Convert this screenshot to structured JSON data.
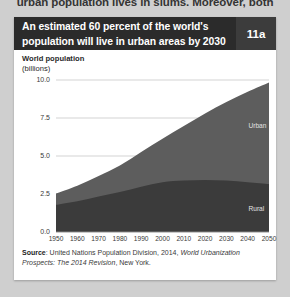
{
  "page": {
    "bleed_text_top": "urban population lives in slums. Moreover, both"
  },
  "figure": {
    "title": "An estimated 60 percent of the world's population will live in urban areas by 2030",
    "badge": "11a",
    "axis_heading_main": "World population",
    "axis_heading_unit": "(billions)",
    "source_prefix": "Source",
    "source_text_a": ": United Nations Population Division, 2014, ",
    "source_italic_a": "World Urbanization Prospects: The 2014 Revision",
    "source_text_b": ", New York.",
    "colors": {
      "title_bar": "#2b2b2b",
      "badge_bg": "#3c3c3c",
      "urban_fill": "#5d5d5d",
      "rural_fill": "#3b3b3b",
      "gridline": "#c8c8c8",
      "panel_bg": "#ffffff",
      "page_bg": "#cfcfcf"
    }
  },
  "chart_data": {
    "type": "area",
    "stacked": true,
    "title": "An estimated 60 percent of the world's population will live in urban areas by 2030",
    "xlabel": "",
    "ylabel": "World population (billions)",
    "x": [
      1950,
      1960,
      1970,
      1980,
      1990,
      2000,
      2010,
      2020,
      2030,
      2040,
      2050
    ],
    "xlim": [
      1950,
      2050
    ],
    "ylim": [
      0.0,
      10.0
    ],
    "yticks": [
      "0.0",
      "2.5",
      "5.0",
      "7.5",
      "10.0"
    ],
    "ytick_values": [
      0.0,
      2.5,
      5.0,
      7.5,
      10.0
    ],
    "xticks": [
      "1950",
      "1960",
      "1970",
      "1980",
      "1990",
      "2000",
      "2010",
      "2020",
      "2030",
      "2040",
      "2050"
    ],
    "grid": true,
    "grid_axis": "y",
    "legend_position": "in-plot-labels",
    "series": [
      {
        "name": "Rural",
        "order": "bottom",
        "color": "#3b3b3b",
        "values": [
          1.79,
          2.03,
          2.34,
          2.63,
          2.98,
          3.27,
          3.38,
          3.42,
          3.38,
          3.28,
          3.15
        ]
      },
      {
        "name": "Urban",
        "order": "top",
        "color": "#5d5d5d",
        "values": [
          0.75,
          1.02,
          1.35,
          1.75,
          2.29,
          2.87,
          3.59,
          4.38,
          5.17,
          5.94,
          6.68
        ]
      }
    ],
    "totals": [
      2.54,
      3.05,
      3.69,
      4.38,
      5.27,
      6.14,
      6.97,
      7.8,
      8.55,
      9.22,
      9.83
    ],
    "annotations": [
      {
        "text": "Urban",
        "x": 2046,
        "y": 7.0
      },
      {
        "text": "Rural",
        "x": 2046,
        "y": 1.5
      }
    ]
  }
}
